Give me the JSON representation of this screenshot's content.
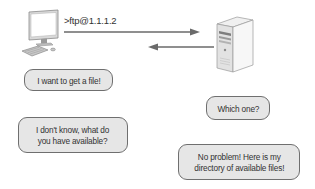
{
  "diagram": {
    "client": {
      "icon": "desktop-computer-icon",
      "command": ">ftp@1.1.1.2"
    },
    "server": {
      "icon": "server-tower-icon"
    },
    "arrows": [
      {
        "direction": "client-to-server",
        "label": "request"
      },
      {
        "direction": "server-to-client",
        "label": "response"
      }
    ],
    "bubbles": [
      {
        "speaker": "client",
        "text": "I want to get a file!"
      },
      {
        "speaker": "server",
        "text": "Which one?"
      },
      {
        "speaker": "client",
        "text": "I don't know, what do\nyou have available?"
      },
      {
        "speaker": "server",
        "text": "No problem! Here is my\ndirectory of available files!"
      }
    ],
    "colors": {
      "bubble_fill": "#e6e6e6",
      "bubble_border": "#6f6f6f",
      "arrow": "#6a6a6a",
      "text": "#333333"
    }
  }
}
